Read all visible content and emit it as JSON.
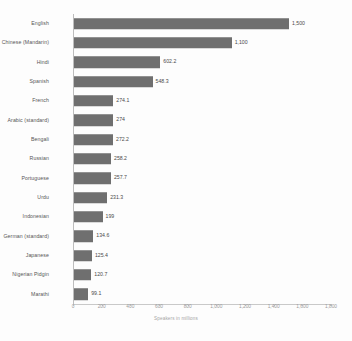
{
  "chart_data": {
    "type": "bar",
    "orientation": "horizontal",
    "title": "",
    "xlabel": "Speakers in millions",
    "ylabel": "",
    "xlim": [
      0,
      1800
    ],
    "grid": false,
    "legend": null,
    "bar_color": "#6f6f6f",
    "categories": [
      "English",
      "Chinese (Mandarin)",
      "Hindi",
      "Spanish",
      "French",
      "Arabic (standard)",
      "Bengali",
      "Russian",
      "Portuguese",
      "Urdu",
      "Indonesian",
      "German (standard)",
      "Japanese",
      "Nigerian Pidgin",
      "Marathi"
    ],
    "values": [
      1500,
      1100,
      602.2,
      548.3,
      274.1,
      274,
      272.2,
      258.2,
      257.7,
      231.3,
      199,
      134.6,
      125.4,
      120.7,
      99.1
    ],
    "value_labels": [
      "1,500",
      "1,100",
      "602.2",
      "548.3",
      "274.1",
      "274",
      "272.2",
      "258.2",
      "257.7",
      "231.3",
      "199",
      "134.6",
      "125.4",
      "120.7",
      "99.1"
    ],
    "xticks": [
      0,
      200,
      400,
      600,
      800,
      1000,
      1200,
      1400,
      1600,
      1800
    ],
    "xtick_labels": [
      "0",
      "200",
      "400",
      "600",
      "800",
      "1,000",
      "1,200",
      "1,400",
      "1,600",
      "1,800"
    ]
  }
}
